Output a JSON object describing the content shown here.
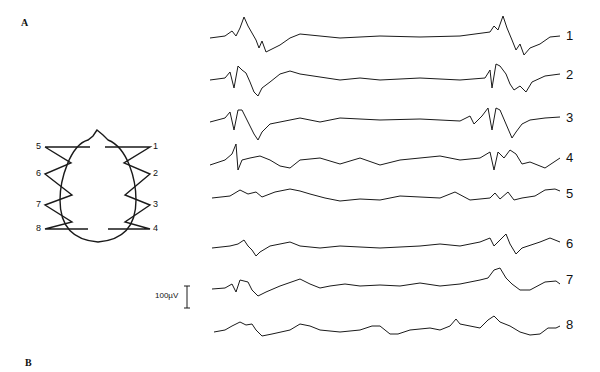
{
  "figure": {
    "panel_a_label": "A",
    "panel_b_label": "B",
    "scale_bar_label": "100µV",
    "montage": {
      "left_electrodes": [
        "5",
        "6",
        "7",
        "8"
      ],
      "right_electrodes": [
        "1",
        "2",
        "3",
        "4"
      ]
    },
    "traces": [
      {
        "label": "1",
        "baseline_y": 37
      },
      {
        "label": "2",
        "baseline_y": 77
      },
      {
        "label": "3",
        "baseline_y": 118
      },
      {
        "label": "4",
        "baseline_y": 158
      },
      {
        "label": "5",
        "baseline_y": 193
      },
      {
        "label": "6",
        "baseline_y": 243
      },
      {
        "label": "7",
        "baseline_y": 283
      },
      {
        "label": "8",
        "baseline_y": 326
      }
    ],
    "line_color": "#1a1a1a"
  }
}
